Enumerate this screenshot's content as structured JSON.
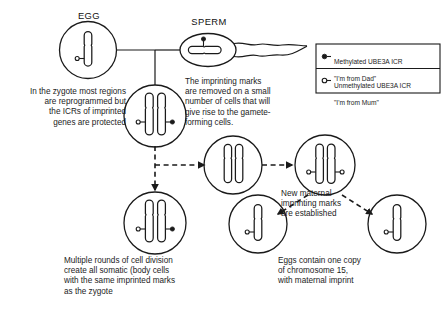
{
  "figure": {
    "background_color": "#ffffff",
    "stroke_color": "#1a1a1a",
    "marker_fill_color": "#1a1a1a",
    "marker_open_color": "#ffffff"
  },
  "gametes": {
    "egg_label": "EGG",
    "sperm_label": "SPERM"
  },
  "annotations": {
    "zygote_note": "In the zygote most regions\nare reprogrammed but\nthe ICRs of imprinted\ngenes are protected",
    "germline_note": "The imprinting marks\nare removed on a small\nnumber of cells that will\ngive rise to the gamete-\nforming cells.",
    "new_maternal_note": "New maternal\nimprinting marks\nare established",
    "somatic_note": "Multiple rounds of cell division\ncreate all somatic (body cells\nwith the same imprinted marks\nas the zygote",
    "eggs_note": "Eggs contain one copy\nof chromosome 15,\nwith maternal imprint"
  },
  "legend": {
    "items": [
      {
        "marker": "methylated-filled-dot",
        "line1": "Methylated UBE3A ICR",
        "line2": "\"I'm from Dad\""
      },
      {
        "marker": "unmethylated-open-circle",
        "line1": "Unmethylated UBE3A ICR",
        "line2": "\"I'm from Mum\""
      }
    ]
  },
  "cells": [
    {
      "name": "egg-cell",
      "chromosomes": 1,
      "markers": [
        "unmethylated"
      ]
    },
    {
      "name": "sperm-cell",
      "chromosomes": 1,
      "markers": [
        "methylated"
      ]
    },
    {
      "name": "zygote-cell",
      "chromosomes": 2,
      "markers": [
        "unmethylated",
        "methylated"
      ]
    },
    {
      "name": "germline-precursor-cell",
      "chromosomes": 2,
      "markers": []
    },
    {
      "name": "reimprinted-germ-cell",
      "chromosomes": 2,
      "markers": [
        "unmethylated",
        "unmethylated"
      ]
    },
    {
      "name": "somatic-cell",
      "chromosomes": 2,
      "markers": [
        "unmethylated",
        "methylated"
      ]
    },
    {
      "name": "mature-egg-cell-left",
      "chromosomes": 1,
      "markers": [
        "unmethylated"
      ]
    },
    {
      "name": "mature-egg-cell-right",
      "chromosomes": 1,
      "markers": [
        "unmethylated"
      ]
    }
  ]
}
